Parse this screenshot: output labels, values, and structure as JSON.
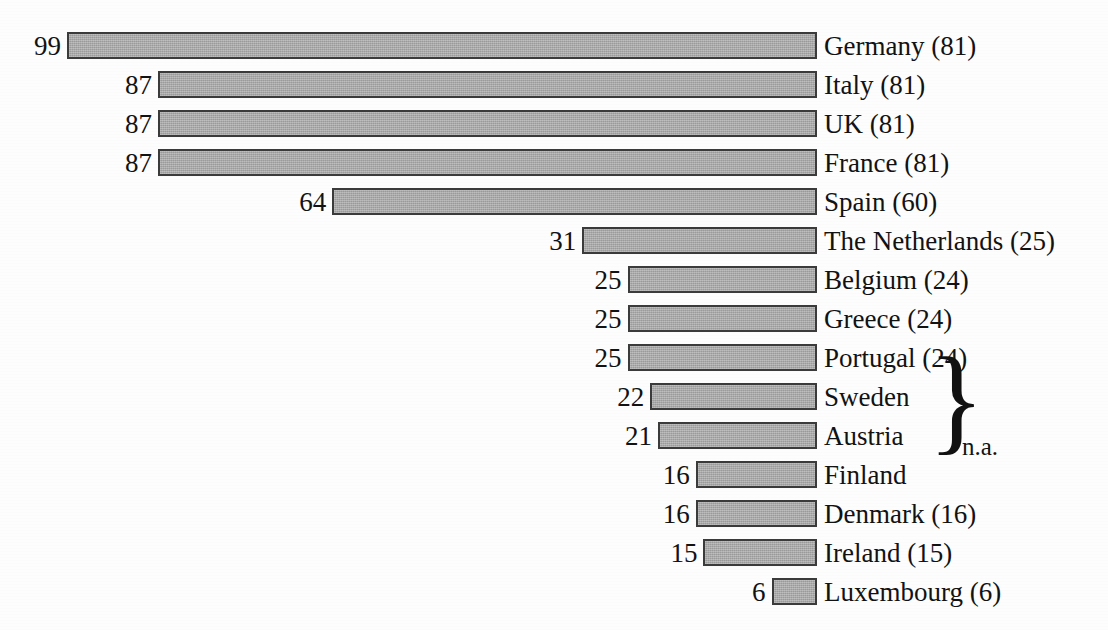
{
  "chart_data": {
    "type": "bar",
    "orientation": "horizontal",
    "title": "",
    "subtitle": "",
    "xlabel": "",
    "ylabel": "",
    "grid": false,
    "legend": null,
    "bars_right_aligned": true,
    "value_label_position": "left-of-bar",
    "category_label_position": "right-of-bar",
    "categories": [
      "Germany",
      "Italy",
      "UK",
      "France",
      "Spain",
      "The Netherlands",
      "Belgium",
      "Greece",
      "Portugal",
      "Sweden",
      "Austria",
      "Finland",
      "Denmark",
      "Ireland",
      "Luxembourg"
    ],
    "values": [
      99,
      87,
      87,
      87,
      64,
      31,
      25,
      25,
      25,
      22,
      21,
      16,
      16,
      15,
      6
    ],
    "secondary_values": [
      81,
      81,
      81,
      81,
      60,
      25,
      24,
      24,
      24,
      null,
      null,
      null,
      16,
      15,
      6
    ],
    "xlim": [
      0,
      99
    ],
    "rows": [
      {
        "label": "Germany (81)",
        "name": "Germany",
        "value": 99,
        "value_text": "99",
        "secondary_text": "(81)"
      },
      {
        "label": "Italy (81)",
        "name": "Italy",
        "value": 87,
        "value_text": "87",
        "secondary_text": "(81)"
      },
      {
        "label": "UK (81)",
        "name": "UK",
        "value": 87,
        "value_text": "87",
        "secondary_text": "(81)"
      },
      {
        "label": "France (81)",
        "name": "France",
        "value": 87,
        "value_text": "87",
        "secondary_text": "(81)"
      },
      {
        "label": "Spain (60)",
        "name": "Spain",
        "value": 64,
        "value_text": "64",
        "secondary_text": "(60)"
      },
      {
        "label": "The Netherlands (25)",
        "name": "The Netherlands",
        "value": 31,
        "value_text": "31",
        "secondary_text": "(25)"
      },
      {
        "label": "Belgium (24)",
        "name": "Belgium",
        "value": 25,
        "value_text": "25",
        "secondary_text": "(24)"
      },
      {
        "label": "Greece (24)",
        "name": "Greece",
        "value": 25,
        "value_text": "25",
        "secondary_text": "(24)"
      },
      {
        "label": "Portugal (24)",
        "name": "Portugal",
        "value": 25,
        "value_text": "25",
        "secondary_text": "(24)"
      },
      {
        "label": "Sweden",
        "name": "Sweden",
        "value": 22,
        "value_text": "22",
        "secondary_text": ""
      },
      {
        "label": "Austria",
        "name": "Austria",
        "value": 21,
        "value_text": "21",
        "secondary_text": ""
      },
      {
        "label": "Finland",
        "name": "Finland",
        "value": 16,
        "value_text": "16",
        "secondary_text": ""
      },
      {
        "label": "Denmark (16)",
        "name": "Denmark",
        "value": 16,
        "value_text": "16",
        "secondary_text": "(16)"
      },
      {
        "label": "Ireland (15)",
        "name": "Ireland",
        "value": 15,
        "value_text": "15",
        "secondary_text": "(15)"
      },
      {
        "label": "Luxembourg (6)",
        "name": "Luxembourg",
        "value": 6,
        "value_text": "6",
        "secondary_text": "(6)"
      }
    ],
    "annotations": [
      {
        "type": "brace",
        "text": "n.a.",
        "groups": [
          "Sweden",
          "Austria",
          "Finland"
        ],
        "note": "curly brace grouping the three rows that have no parenthetical value"
      }
    ],
    "colors": {
      "bar_fill": "#a9a9a9",
      "bar_border": "#3b3b3b",
      "text": "#121212",
      "background": "#fdfdfd"
    }
  },
  "annotation": {
    "na_text": "n.a.",
    "brace_glyph": "}"
  },
  "geometry": {
    "bar_right_x": 817,
    "bar_left_min_x": 67,
    "first_row_top": 32,
    "row_pitch": 39,
    "bar_height": 27,
    "px_per_unit": 7.576,
    "label_x": 824,
    "value_gap": 6,
    "brace": {
      "x": 928,
      "top": 383,
      "height": 104,
      "font_size": 118
    },
    "na": {
      "x": 962,
      "y": 434
    }
  }
}
